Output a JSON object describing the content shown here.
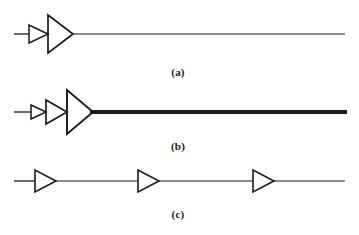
{
  "figure": {
    "type": "diagram",
    "background_color": "#ffffff",
    "stroke_color": "#1a1a1a",
    "width": 359,
    "height": 235
  },
  "captions": {
    "a": "(a)",
    "b": "(b)",
    "c": "(c)"
  },
  "panels": [
    {
      "id": "a",
      "caption": "(a)",
      "baseline_y": 34,
      "input_line": {
        "x1": 14,
        "x2": 28,
        "thickness": 1
      },
      "output_line": {
        "x1": 72,
        "x2": 345,
        "thickness": 1
      },
      "amplifiers": [
        {
          "index": 1,
          "x": 28,
          "width": 20,
          "height": 18,
          "size": "small"
        },
        {
          "index": 2,
          "x": 48,
          "width": 24,
          "height": 38,
          "size": "large"
        }
      ]
    },
    {
      "id": "b",
      "caption": "(b)",
      "baseline_y": 112,
      "input_line": {
        "x1": 14,
        "x2": 30,
        "thickness": 1
      },
      "output_line": {
        "x1": 92,
        "x2": 347,
        "thickness": 4
      },
      "amplifiers": [
        {
          "index": 1,
          "x": 30,
          "width": 16,
          "height": 14,
          "size": "small"
        },
        {
          "index": 2,
          "x": 46,
          "width": 20,
          "height": 24,
          "size": "medium"
        },
        {
          "index": 3,
          "x": 66,
          "width": 26,
          "height": 44,
          "size": "large"
        }
      ]
    },
    {
      "id": "c",
      "caption": "(c)",
      "baseline_y": 181,
      "input_line": {
        "x1": 14,
        "x2": 34,
        "thickness": 1
      },
      "output_line": {
        "x1": 272,
        "x2": 345,
        "thickness": 1
      },
      "amplifiers": [
        {
          "index": 1,
          "x": 34,
          "width": 21,
          "height": 22,
          "size": "equal"
        },
        {
          "index": 2,
          "x": 137,
          "width": 21,
          "height": 22,
          "size": "equal"
        },
        {
          "index": 3,
          "x": 252,
          "width": 21,
          "height": 22,
          "size": "equal"
        }
      ]
    }
  ]
}
